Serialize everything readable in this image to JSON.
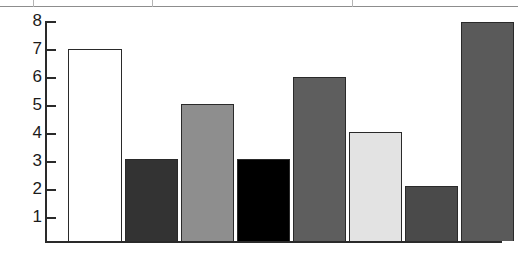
{
  "chart_data": {
    "type": "bar",
    "title": "",
    "subtitle": "",
    "xlabel": "",
    "ylabel": "",
    "categories": [
      "1",
      "2",
      "3",
      "4",
      "5",
      "6",
      "7",
      "8"
    ],
    "values": [
      7,
      3,
      5,
      3,
      6,
      4,
      2,
      8
    ],
    "ylim": [
      0,
      8
    ],
    "ytick_labels": [
      "8",
      "7",
      "6",
      "5",
      "4",
      "3",
      "2",
      "1"
    ],
    "yticks": [
      8,
      7,
      6,
      5,
      4,
      3,
      2,
      1
    ],
    "xtick_labels": [],
    "grid": false,
    "legend": null,
    "legend_position": "none",
    "annotations": [],
    "bar_colors": [
      "#ffffff",
      "#333333",
      "#8e8e8e",
      "#000000",
      "#5e5e5e",
      "#e3e3e3",
      "#4a4a4a",
      "#5a5a5a"
    ],
    "bar_border_color": "#2a2a2a",
    "axis_color": "#2a2a2a",
    "background_color": "#ffffff",
    "series": [
      {
        "name": "",
        "values": [
          7,
          3,
          5,
          3,
          6,
          4,
          2,
          8
        ]
      }
    ]
  },
  "page": {
    "rule_color": "#8d8d8d"
  }
}
